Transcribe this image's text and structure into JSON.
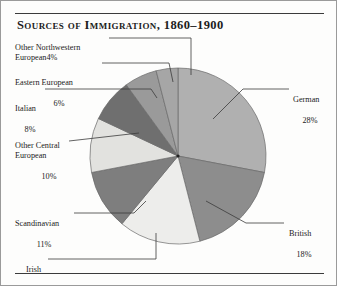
{
  "chart_data": {
    "type": "pie",
    "title": "Sources of Immigration, 1860–1900",
    "xlabel": "",
    "ylabel": "",
    "legend_position": "callout-labels",
    "grid": false,
    "units": "percent",
    "start_angle_deg": 0,
    "direction": "clockwise",
    "categories": [
      "German",
      "British",
      "Irish",
      "Scandinavian",
      "Other Central European",
      "Italian",
      "Eastern European",
      "Other Northwestern European"
    ],
    "values": [
      28,
      18,
      15,
      11,
      10,
      8,
      6,
      4
    ],
    "slices": [
      {
        "label": "German",
        "value": 28,
        "value_text": "28%",
        "color": "#b0b0b0"
      },
      {
        "label": "British",
        "value": 18,
        "value_text": "18%",
        "color": "#8d8d8d"
      },
      {
        "label": "Irish",
        "value": 15,
        "value_text": "15%",
        "color": "#ededeb"
      },
      {
        "label": "Scandinavian",
        "value": 11,
        "value_text": "11%",
        "color": "#7e7e7e"
      },
      {
        "label": "Other Central European",
        "value": 10,
        "value_text": "10%",
        "color": "#e2e2df"
      },
      {
        "label": "Italian",
        "value": 8,
        "value_text": "8%",
        "color": "#6f6f6f"
      },
      {
        "label": "Eastern European",
        "value": 6,
        "value_text": "6%",
        "color": "#9a9a9a"
      },
      {
        "label": "Other Northwestern European",
        "value": 4,
        "value_text": "4%",
        "color": "#a6a6a6"
      }
    ]
  },
  "labels": {
    "other_northwestern": {
      "name": "Other Northwestern\nEuropean",
      "pct": "4%"
    },
    "eastern_european": {
      "name": "Eastern European",
      "pct": "6%"
    },
    "italian": {
      "name": "Italian",
      "pct": "8%"
    },
    "other_central": {
      "name": "Other Central\nEuropean",
      "pct": "10%"
    },
    "scandinavian": {
      "name": "Scandinavian",
      "pct": "11%"
    },
    "irish": {
      "name": "Irish",
      "pct": "15%"
    },
    "german": {
      "name": "German",
      "pct": "28%"
    },
    "british": {
      "name": "British",
      "pct": "18%"
    }
  },
  "style": {
    "outline_color": "#6a6a6a",
    "leader_color": "#3b3b3b",
    "rule_color": "#3b3b3b"
  }
}
